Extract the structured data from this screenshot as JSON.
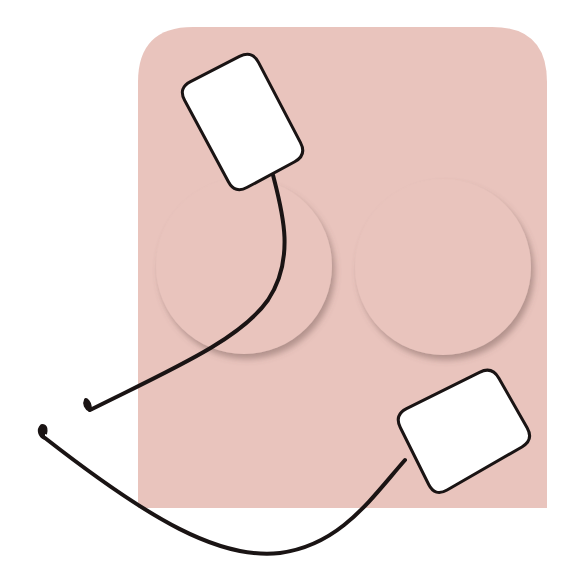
{
  "diagram": {
    "colors": {
      "background": "#ffffff",
      "backing_sheet": "#e9c4bd",
      "circle_shadow": "#b89892",
      "pad_fill": "#ffffff",
      "outline": "#1a1414",
      "wire": "#1a1414"
    },
    "backing_sheet": {
      "x": 138,
      "y": 27,
      "width": 409,
      "height": 481,
      "top_left_radius": 55,
      "top_right_radius": 55
    },
    "placement_circles": [
      {
        "id": "circle-left",
        "cx": 244,
        "cy": 266,
        "r": 88
      },
      {
        "id": "circle-right",
        "cx": 443,
        "cy": 267,
        "r": 88
      }
    ],
    "electrode_pads": [
      {
        "id": "pad-top",
        "points": [
          [
            178,
            88
          ],
          [
            252,
            50
          ],
          [
            307,
            155
          ],
          [
            235,
            194
          ]
        ],
        "corner_radius": 14
      },
      {
        "id": "pad-bottom",
        "points": [
          [
            394,
            415
          ],
          [
            492,
            366
          ],
          [
            534,
            440
          ],
          [
            435,
            497
          ]
        ],
        "corner_radius": 14
      }
    ],
    "lead_wires": [
      {
        "id": "wire-top",
        "path": "M273,175 C282,210 296,258 268,300 C240,340 170,370 90,410",
        "hook": "M90,410 C86,408 84,404 86,400 C89,402 90,406 90,410"
      },
      {
        "id": "wire-bottom",
        "path": "M405,460 C370,500 340,545 280,553 C220,560 150,520 45,438",
        "hook": "M45,438 C40,436 38,430 42,426 C46,426 46,430 45,434"
      }
    ]
  }
}
